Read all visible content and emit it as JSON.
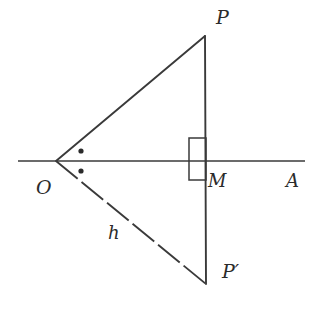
{
  "figure": {
    "background_color": "#ffffff",
    "stroke_color": "#3a3a3a",
    "label_color": "#2b2b2b",
    "labels": {
      "P": "P",
      "O": "O",
      "M": "M",
      "A": "A",
      "h": "h",
      "P_prime": "P′"
    },
    "points": {
      "O": {
        "x": 56,
        "y": 161
      },
      "P": {
        "x": 205,
        "y": 36
      },
      "P_prime": {
        "x": 206,
        "y": 284
      },
      "M": {
        "x": 206,
        "y": 161
      },
      "A_axis_end": {
        "x": 305,
        "y": 161
      },
      "axis_start": {
        "x": 18,
        "y": 161
      }
    },
    "segments": [
      {
        "name": "axis-OA",
        "from": "axis_start",
        "to": "A_axis_end",
        "style": "solid"
      },
      {
        "name": "ray-OP",
        "from": "O",
        "to": "P",
        "style": "solid"
      },
      {
        "name": "ray-OP-prime",
        "from": "O",
        "to": "P_prime",
        "style": "dashed"
      },
      {
        "name": "segment-PP-prime",
        "from": "P",
        "to": "P_prime",
        "style": "solid"
      }
    ],
    "right_angle_marker": {
      "name": "right-angle-square-at-M",
      "x": 189,
      "y": 138,
      "width": 17,
      "height": 42
    },
    "angle_dots": [
      {
        "name": "angle-dot-upper",
        "x": 81,
        "y": 151,
        "r": 2.6
      },
      {
        "name": "angle-dot-lower",
        "x": 81,
        "y": 171,
        "r": 2.6
      }
    ],
    "dash_pattern": "28 5"
  }
}
